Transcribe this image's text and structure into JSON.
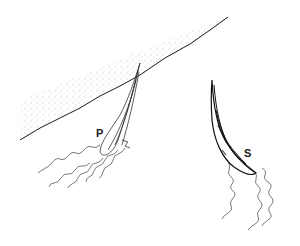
{
  "figure": {
    "labels": {
      "left_organism": "P",
      "right_organism": "S"
    },
    "colors": {
      "line": "#1a1a1a",
      "stipple": "#9a9a9a",
      "background": "#ffffff"
    }
  }
}
